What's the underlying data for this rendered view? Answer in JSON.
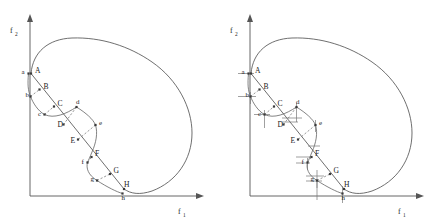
{
  "figure": {
    "title": "",
    "panel_count": 2,
    "axes": {
      "x_label": "f",
      "x_sub": "1",
      "y_label": "f",
      "y_sub": "2"
    },
    "colors": {
      "stroke": "#555555",
      "point": "#3a3a3a",
      "dash": "#6a6a6a",
      "tick": "#777777",
      "background": "#ffffff"
    }
  },
  "panels": [
    {
      "id": "left",
      "name": "panel-left",
      "show_ticks": false,
      "x_label": "f",
      "x_sub": "1",
      "y_label": "f",
      "y_sub": "2",
      "upper_points": [
        {
          "label": "A",
          "x": 31.0,
          "y": 73.5,
          "lx": 35.0,
          "ly": 73.0
        },
        {
          "label": "B",
          "x": 39.5,
          "y": 89.5,
          "lx": 43.5,
          "ly": 88.5
        },
        {
          "label": "C",
          "x": 54.0,
          "y": 106.5,
          "lx": 57.5,
          "ly": 105.5
        },
        {
          "label": "D",
          "x": 63.5,
          "y": 124.5,
          "lx": 57.5,
          "ly": 126.5
        },
        {
          "label": "E",
          "x": 78.0,
          "y": 139.5,
          "lx": 70.5,
          "ly": 143.0
        },
        {
          "label": "F",
          "x": 91.5,
          "y": 157.0,
          "lx": 95.0,
          "ly": 156.0
        },
        {
          "label": "G",
          "x": 110.0,
          "y": 174.0,
          "lx": 113.5,
          "ly": 173.0
        },
        {
          "label": "H",
          "x": 124.0,
          "y": 189.0,
          "lx": 124.0,
          "ly": 186.5
        }
      ],
      "lower_points": [
        {
          "label": "a",
          "x": 28.5,
          "y": 73.5,
          "lx": 21.5,
          "ly": 74.0
        },
        {
          "label": "b",
          "x": 30.5,
          "y": 96.5,
          "lx": 25.5,
          "ly": 97.0
        },
        {
          "label": "c",
          "x": 44.5,
          "y": 114.5,
          "lx": 38.0,
          "ly": 115.5
        },
        {
          "label": "d",
          "x": 76.5,
          "y": 107.0,
          "lx": 76.0,
          "ly": 104.0
        },
        {
          "label": "e",
          "x": 95.5,
          "y": 125.0,
          "lx": 99.0,
          "ly": 124.5
        },
        {
          "label": "f",
          "x": 87.5,
          "y": 162.5,
          "lx": 81.5,
          "ly": 163.5
        },
        {
          "label": "g",
          "x": 97.0,
          "y": 180.5,
          "lx": 90.5,
          "ly": 181.0
        },
        {
          "label": "h",
          "x": 122.5,
          "y": 193.5,
          "lx": 121.5,
          "ly": 200.0
        }
      ],
      "dash_pairs": [
        {
          "from": "b",
          "to": "B"
        },
        {
          "from": "c",
          "to": "C"
        },
        {
          "from": "d",
          "to": "D"
        },
        {
          "from": "e",
          "to": "E"
        },
        {
          "from": "f",
          "to": "F"
        },
        {
          "from": "g",
          "to": "G"
        }
      ]
    },
    {
      "id": "right",
      "name": "panel-right",
      "show_ticks": true,
      "x_label": "f",
      "x_sub": "1",
      "y_label": "f",
      "y_sub": "2",
      "upper_points": [
        {
          "label": "A",
          "x": 31.0,
          "y": 73.5,
          "lx": 35.0,
          "ly": 73.0
        },
        {
          "label": "B",
          "x": 39.5,
          "y": 89.5,
          "lx": 43.5,
          "ly": 88.5
        },
        {
          "label": "C",
          "x": 54.0,
          "y": 106.5,
          "lx": 57.5,
          "ly": 105.5
        },
        {
          "label": "D",
          "x": 63.5,
          "y": 124.5,
          "lx": 57.5,
          "ly": 126.5
        },
        {
          "label": "E",
          "x": 78.0,
          "y": 139.5,
          "lx": 70.5,
          "ly": 143.0
        },
        {
          "label": "F",
          "x": 91.5,
          "y": 157.0,
          "lx": 95.0,
          "ly": 156.0
        },
        {
          "label": "G",
          "x": 110.0,
          "y": 174.0,
          "lx": 113.5,
          "ly": 173.0
        },
        {
          "label": "H",
          "x": 124.0,
          "y": 189.0,
          "lx": 124.0,
          "ly": 186.5
        }
      ],
      "lower_points": [
        {
          "label": "a",
          "x": 28.5,
          "y": 73.5,
          "lx": 21.5,
          "ly": 74.0
        },
        {
          "label": "b",
          "x": 30.5,
          "y": 96.5,
          "lx": 25.5,
          "ly": 97.0
        },
        {
          "label": "c",
          "x": 44.5,
          "y": 114.5,
          "lx": 38.0,
          "ly": 115.5
        },
        {
          "label": "d",
          "x": 76.5,
          "y": 107.0,
          "lx": 76.0,
          "ly": 104.0
        },
        {
          "label": "e",
          "x": 95.5,
          "y": 125.0,
          "lx": 99.0,
          "ly": 124.5
        },
        {
          "label": "f",
          "x": 87.5,
          "y": 162.5,
          "lx": 81.5,
          "ly": 163.5
        },
        {
          "label": "g",
          "x": 97.0,
          "y": 180.5,
          "lx": 90.5,
          "ly": 181.0
        },
        {
          "label": "h",
          "x": 122.5,
          "y": 193.5,
          "lx": 121.5,
          "ly": 200.0
        }
      ],
      "dash_pairs": [
        {
          "from": "b",
          "to": "B"
        },
        {
          "from": "c",
          "to": "C"
        },
        {
          "from": "d",
          "to": "D"
        },
        {
          "from": "e",
          "to": "E"
        },
        {
          "from": "f",
          "to": "F"
        },
        {
          "from": "g",
          "to": "G"
        }
      ],
      "tick_labels": [
        "a",
        "b",
        "c",
        "d",
        "e",
        "f",
        "g",
        "h"
      ]
    }
  ],
  "chart_data": {
    "type": "scatter",
    "title": "",
    "subtitle": "",
    "xlabel": "f1",
    "ylabel": "f2",
    "xlim": [
      0,
      1
    ],
    "ylim": [
      0,
      1
    ],
    "grid": false,
    "legend": null,
    "annotations": [
      "Closed feasible-region boundary in objective space",
      "Chain A-B-C-D-E-F-G-H lies on a descending straight line",
      "Points a-h lie on a scalloped boundary curve",
      "Dashed segments connect each lowercase point to its uppercase counterpart",
      "Right panel adds axis projection tick marks for a-h"
    ],
    "series": [
      {
        "name": "upper chain (A-H)",
        "labels": [
          "A",
          "B",
          "C",
          "D",
          "E",
          "F",
          "G",
          "H"
        ],
        "x": [
          0.055,
          0.125,
          0.245,
          0.325,
          0.445,
          0.555,
          0.705,
          0.82
        ],
        "y": [
          0.695,
          0.605,
          0.51,
          0.41,
          0.325,
          0.23,
          0.135,
          0.05
        ]
      },
      {
        "name": "lower scallop (a-h)",
        "labels": [
          "a",
          "b",
          "c",
          "d",
          "e",
          "f",
          "g",
          "h"
        ],
        "x": [
          0.035,
          0.05,
          0.16,
          0.425,
          0.58,
          0.495,
          0.575,
          0.81
        ],
        "y": [
          0.695,
          0.565,
          0.465,
          0.505,
          0.405,
          0.175,
          0.075,
          0.025
        ]
      }
    ]
  }
}
